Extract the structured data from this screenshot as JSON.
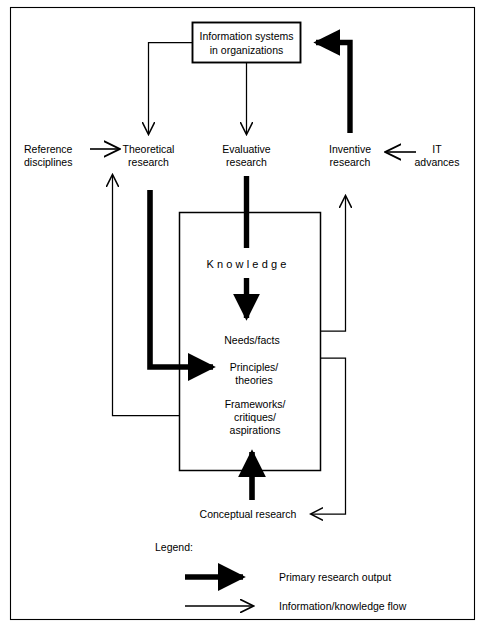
{
  "figure": {
    "title_visible": false,
    "border": {
      "name": "outer-frame",
      "color": "#000000"
    },
    "colors": {
      "stroke": "#000000",
      "background": "#ffffff",
      "thick_arrow": "#000000",
      "thin_arrow": "#000000"
    }
  },
  "nodes": {
    "information_systems": {
      "line1": "Information systems",
      "line2": "in organizations"
    },
    "reference_disciplines": {
      "line1": "Reference",
      "line2": "disciplines"
    },
    "theoretical_research": {
      "line1": "Theoretical",
      "line2": "research"
    },
    "evaluative_research": {
      "line1": "Evaluative",
      "line2": "research"
    },
    "inventive_research": {
      "line1": "Inventive",
      "line2": "research"
    },
    "it_advances": {
      "line1": "IT",
      "line2": "advances"
    },
    "knowledge": {
      "label": "Knowledge"
    },
    "needs_facts": {
      "label": "Needs/facts"
    },
    "principles_theories": {
      "line1": "Principles/",
      "line2": "theories"
    },
    "frameworks": {
      "line1": "Frameworks/",
      "line2": "critiques/",
      "line3": "aspirations"
    },
    "conceptual_research": {
      "label": "Conceptual research"
    }
  },
  "legend": {
    "title": "Legend:",
    "items": [
      {
        "type": "thick-arrow",
        "label": "Primary research output"
      },
      {
        "type": "thin-arrow",
        "label": "Information/knowledge flow"
      }
    ]
  },
  "edges": [
    {
      "name": "is-to-theoretical",
      "from": "information_systems",
      "to": "theoretical_research",
      "style": "thin"
    },
    {
      "name": "is-to-evaluative",
      "from": "information_systems",
      "to": "evaluative_research",
      "style": "thin"
    },
    {
      "name": "inventive-to-is",
      "from": "inventive_research",
      "to": "information_systems",
      "style": "thick"
    },
    {
      "name": "reference-to-theoretical",
      "from": "reference_disciplines",
      "to": "theoretical_research",
      "style": "thin"
    },
    {
      "name": "it-advances-to-inventive",
      "from": "it_advances",
      "to": "inventive_research",
      "style": "thin"
    },
    {
      "name": "theoretical-to-principles",
      "from": "theoretical_research",
      "to": "principles_theories",
      "style": "thick"
    },
    {
      "name": "evaluative-to-knowledge",
      "from": "evaluative_research",
      "to": "knowledge",
      "style": "thick"
    },
    {
      "name": "knowledge-to-needs",
      "from": "knowledge",
      "to": "needs_facts",
      "style": "thick"
    },
    {
      "name": "conceptual-to-frameworks",
      "from": "conceptual_research",
      "to": "frameworks",
      "style": "thick"
    },
    {
      "name": "needs-to-inventive",
      "from": "needs_facts",
      "to": "inventive_research",
      "style": "thin"
    },
    {
      "name": "frameworks-to-theoretical",
      "from": "frameworks",
      "to": "theoretical_research",
      "style": "thin"
    },
    {
      "name": "knowledge-to-conceptual",
      "from": "knowledge",
      "to": "conceptual_research",
      "style": "thin"
    }
  ]
}
